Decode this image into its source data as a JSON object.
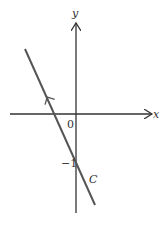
{
  "diagram": {
    "axes": {
      "x_label": "x",
      "y_label": "y",
      "origin_label": "0"
    },
    "line": {
      "label": "C",
      "y_intercept_label": "−1"
    },
    "colors": {
      "axis": "#333333",
      "line": "#555555",
      "text": "#333333"
    }
  }
}
